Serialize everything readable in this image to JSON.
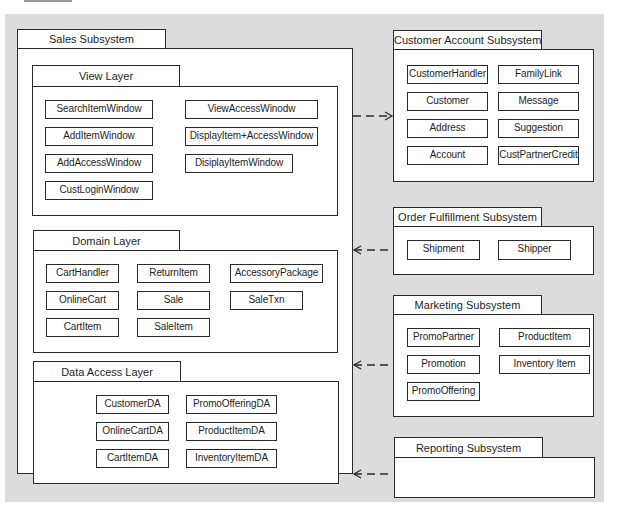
{
  "diagram": {
    "sales": {
      "title": "Sales Subsystem",
      "view_layer": {
        "title": "View Layer",
        "classes": [
          "SearchItemWindow",
          "AddItemWindow",
          "AddAccessWindow",
          "CustLoginWindow",
          "ViewAccessWinodw",
          "DisplayItem+AccessWindow",
          "DisiplayItemWindow"
        ]
      },
      "domain_layer": {
        "title": "Domain Layer",
        "classes": [
          "CartHandler",
          "OnlineCart",
          "CartItem",
          "ReturnItem",
          "Sale",
          "SaleItem",
          "AccessoryPackage",
          "SaleTxn"
        ]
      },
      "data_access_layer": {
        "title": "Data Access Layer",
        "classes": [
          "CustomerDA",
          "OnlineCartDA",
          "CartItemDA",
          "PromoOfferingDA",
          "ProductItemDA",
          "InventoryItemDA"
        ]
      }
    },
    "customer_account": {
      "title": "Customer Account Subsystem",
      "classes": [
        "CustomerHandler",
        "Customer",
        "Address",
        "Account",
        "FamilyLink",
        "Message",
        "Suggestion",
        "CustPartnerCredit"
      ]
    },
    "order_fulfillment": {
      "title": "Order Fulfillment Subsystem",
      "classes": [
        "Shipment",
        "Shipper"
      ]
    },
    "marketing": {
      "title": "Marketing Subsystem",
      "classes": [
        "PromoPartner",
        "Promotion",
        "PromoOffering",
        "ProductItem",
        "Inventory Item"
      ]
    },
    "reporting": {
      "title": "Reporting Subsystem",
      "classes": []
    },
    "dependencies": [
      {
        "from": "Sales Subsystem",
        "to": "Customer Account Subsystem",
        "style": "dashed"
      },
      {
        "from": "Order Fulfillment Subsystem",
        "to": "Sales Subsystem",
        "style": "dashed"
      },
      {
        "from": "Marketing Subsystem",
        "to": "Sales Subsystem",
        "style": "dashed"
      },
      {
        "from": "Reporting Subsystem",
        "to": "Sales Subsystem",
        "style": "dashed"
      }
    ],
    "colors": {
      "background": "#dcdcdc",
      "box": "#ffffff",
      "line": "#2a2a2a"
    }
  }
}
